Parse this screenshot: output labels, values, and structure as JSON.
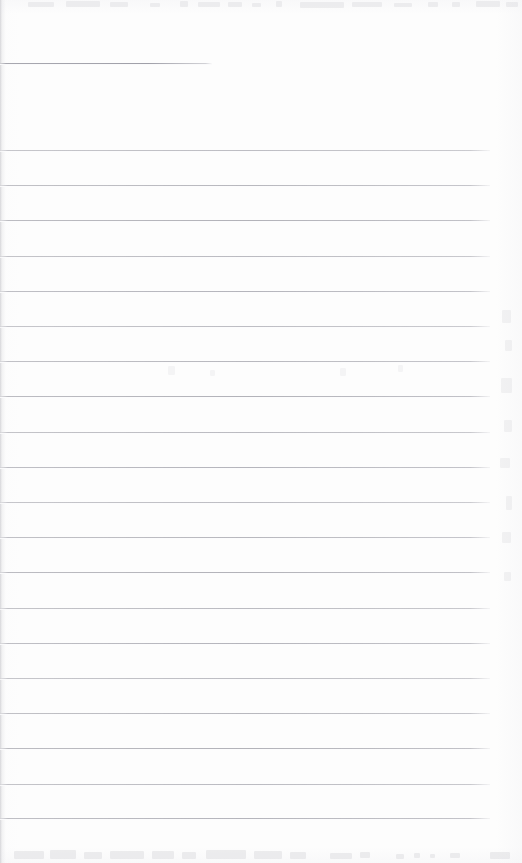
{
  "document": {
    "type": "scanned-lined-notebook-page",
    "content_text": "",
    "page_width": 522,
    "page_height": 863
  },
  "colors": {
    "page_background": "#fdfdfd",
    "rule_line": "#b0b0b7",
    "heading_rule": "#a0a0a9",
    "ghost_mark": "#d9d9dd",
    "edge_shadow": "#cdcdd1"
  },
  "heading_rule": {
    "label": "heading-underline",
    "x": 0,
    "y": 63,
    "width": 212
  },
  "ruled_lines": {
    "count": 20,
    "first_y": 150,
    "spacing": 35.2,
    "x_start": 0,
    "x_end": 490,
    "positions": [
      150,
      185,
      220,
      256,
      291,
      326,
      361,
      396,
      432,
      467,
      502,
      537,
      572,
      608,
      643,
      678,
      713,
      748,
      784,
      818
    ]
  },
  "ghosts": {
    "top": [
      {
        "x": 28,
        "y": 2,
        "w": 26,
        "h": 5
      },
      {
        "x": 66,
        "y": 1,
        "w": 34,
        "h": 6
      },
      {
        "x": 110,
        "y": 2,
        "w": 18,
        "h": 5
      },
      {
        "x": 150,
        "y": 3,
        "w": 10,
        "h": 4
      },
      {
        "x": 180,
        "y": 1,
        "w": 8,
        "h": 6
      },
      {
        "x": 198,
        "y": 2,
        "w": 22,
        "h": 5
      },
      {
        "x": 228,
        "y": 2,
        "w": 14,
        "h": 5
      },
      {
        "x": 252,
        "y": 3,
        "w": 9,
        "h": 4
      },
      {
        "x": 276,
        "y": 1,
        "w": 6,
        "h": 6
      },
      {
        "x": 300,
        "y": 2,
        "w": 44,
        "h": 6
      },
      {
        "x": 352,
        "y": 2,
        "w": 30,
        "h": 5
      },
      {
        "x": 394,
        "y": 3,
        "w": 18,
        "h": 4
      },
      {
        "x": 428,
        "y": 2,
        "w": 10,
        "h": 5
      },
      {
        "x": 452,
        "y": 2,
        "w": 8,
        "h": 5
      },
      {
        "x": 476,
        "y": 1,
        "w": 24,
        "h": 6
      },
      {
        "x": 506,
        "y": 2,
        "w": 12,
        "h": 5
      }
    ],
    "bottom": [
      {
        "x": 14,
        "y": 6,
        "w": 30,
        "h": 8
      },
      {
        "x": 50,
        "y": 5,
        "w": 26,
        "h": 9
      },
      {
        "x": 84,
        "y": 7,
        "w": 18,
        "h": 7
      },
      {
        "x": 110,
        "y": 6,
        "w": 34,
        "h": 8
      },
      {
        "x": 152,
        "y": 6,
        "w": 22,
        "h": 8
      },
      {
        "x": 182,
        "y": 7,
        "w": 14,
        "h": 7
      },
      {
        "x": 206,
        "y": 5,
        "w": 40,
        "h": 9
      },
      {
        "x": 254,
        "y": 6,
        "w": 28,
        "h": 8
      },
      {
        "x": 290,
        "y": 7,
        "w": 16,
        "h": 7
      },
      {
        "x": 330,
        "y": 8,
        "w": 22,
        "h": 6
      },
      {
        "x": 360,
        "y": 7,
        "w": 10,
        "h": 6
      },
      {
        "x": 396,
        "y": 9,
        "w": 8,
        "h": 5
      },
      {
        "x": 414,
        "y": 8,
        "w": 6,
        "h": 5
      },
      {
        "x": 430,
        "y": 9,
        "w": 5,
        "h": 4
      },
      {
        "x": 450,
        "y": 8,
        "w": 10,
        "h": 5
      },
      {
        "x": 490,
        "y": 7,
        "w": 20,
        "h": 7
      }
    ],
    "right": [
      {
        "x": 4,
        "y": 10,
        "w": 9,
        "h": 13
      },
      {
        "x": 7,
        "y": 40,
        "w": 7,
        "h": 11
      },
      {
        "x": 3,
        "y": 78,
        "w": 11,
        "h": 15
      },
      {
        "x": 6,
        "y": 120,
        "w": 8,
        "h": 12
      },
      {
        "x": 2,
        "y": 158,
        "w": 10,
        "h": 10
      },
      {
        "x": 8,
        "y": 196,
        "w": 6,
        "h": 14
      },
      {
        "x": 4,
        "y": 232,
        "w": 9,
        "h": 11
      },
      {
        "x": 6,
        "y": 272,
        "w": 7,
        "h": 9
      }
    ],
    "mid": [
      {
        "x": 18,
        "y": 6,
        "w": 7,
        "h": 9
      },
      {
        "x": 60,
        "y": 10,
        "w": 5,
        "h": 6
      },
      {
        "x": 190,
        "y": 8,
        "w": 6,
        "h": 8
      },
      {
        "x": 248,
        "y": 5,
        "w": 5,
        "h": 7
      }
    ]
  }
}
